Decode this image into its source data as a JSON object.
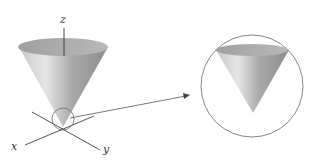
{
  "figure": {
    "axes": {
      "x": "x",
      "y": "y",
      "z": "z"
    },
    "colors": {
      "cone_light": "#d8d8d8",
      "cone_dark": "#8a8a8a",
      "line": "#555555"
    }
  }
}
